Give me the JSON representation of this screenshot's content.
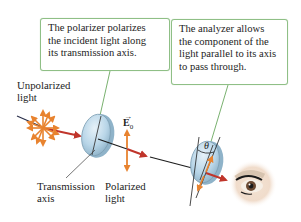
{
  "callouts": {
    "polarizer": {
      "lines": [
        "The polarizer polarizes",
        "the incident light along",
        "its transmission axis."
      ]
    },
    "analyzer": {
      "lines": [
        "The analyzer allows",
        "the component of the",
        "light parallel to its axis",
        "to pass through."
      ]
    }
  },
  "labels": {
    "unpolarized": [
      "Unpolarized",
      "light"
    ],
    "transmission_axis": [
      "Transmission",
      "axis"
    ],
    "polarized": [
      "Polarized",
      "light"
    ],
    "e_field": "E",
    "e_field_subscript": "0",
    "theta": "θ"
  },
  "colors": {
    "callout_border": "#8fbf86",
    "leader_line": "#6aa85f",
    "beam_red": "#c0352b",
    "field_arrow_orange": "#e8832f",
    "lens_fill": "#b9d6e8",
    "lens_edge": "#7d9fb4"
  }
}
